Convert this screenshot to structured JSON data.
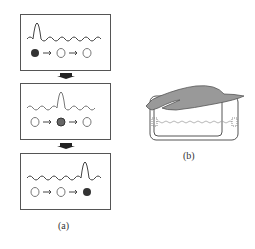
{
  "panel_a": {
    "label": "(a)",
    "frames": [
      {
        "peak_position": 0,
        "excited_node": 0
      },
      {
        "peak_position": 1,
        "excited_node": 1
      },
      {
        "peak_position": 2,
        "excited_node": 2
      }
    ],
    "nodes_per_frame": 3
  },
  "panel_b": {
    "label": "(b)"
  },
  "colors": {
    "stroke": "#555555",
    "shade": "#999999",
    "node_fill": "#333333"
  }
}
